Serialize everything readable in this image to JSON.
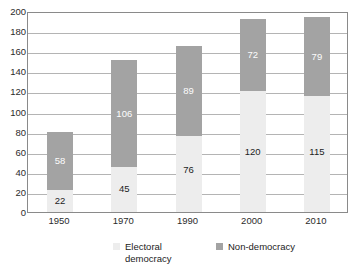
{
  "chart_data": {
    "type": "bar",
    "title": "",
    "subtitle": "",
    "xlabel": "",
    "ylabel": "",
    "stacked": true,
    "grid": true,
    "legend_position": "bottom",
    "categories": [
      "1950",
      "1970",
      "1990",
      "2000",
      "2010"
    ],
    "ylim": [
      0,
      200
    ],
    "ytick_step": 20,
    "ytick_labels": [
      "200",
      "180",
      "160",
      "140",
      "120",
      "100",
      "80",
      "60",
      "40",
      "20",
      "0"
    ],
    "ytick_values": [
      200,
      180,
      160,
      140,
      120,
      100,
      80,
      60,
      40,
      20,
      0
    ],
    "series": [
      {
        "name": "Electoral democracy",
        "key": "electoral_democracy",
        "color": "#ededed",
        "values": [
          22,
          45,
          76,
          120,
          115
        ]
      },
      {
        "name": "Non-democracy",
        "key": "non_democracy",
        "color": "#a3a3a3",
        "values": [
          58,
          106,
          89,
          72,
          79
        ]
      }
    ],
    "totals": [
      80,
      151,
      165,
      192,
      194
    ],
    "data_labels": {
      "electoral_democracy": [
        "22",
        "45",
        "76",
        "120",
        "115"
      ],
      "non_democracy": [
        "58",
        "106",
        "89",
        "72",
        "79"
      ]
    }
  },
  "legend": {
    "items": [
      {
        "label": "Electoral\ndemocracy",
        "color": "#ededed"
      },
      {
        "label": "Non-democracy",
        "color": "#a3a3a3"
      }
    ]
  },
  "axes": {
    "y": {
      "labels": [
        "200",
        "180",
        "160",
        "140",
        "120",
        "100",
        "80",
        "60",
        "40",
        "20",
        "0"
      ]
    },
    "x": {
      "labels": [
        "1950",
        "1970",
        "1990",
        "2000",
        "2010"
      ]
    }
  },
  "colors": {
    "electoral_democracy": "#ededed",
    "non_democracy": "#a3a3a3",
    "gridline": "#b4b4b4",
    "axis": "#8a8a8a",
    "text": "#232323",
    "background": "#ffffff"
  }
}
